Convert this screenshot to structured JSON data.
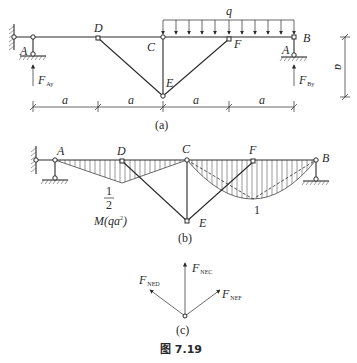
{
  "figure": {
    "caption": "图 7.19",
    "colors": {
      "ink": "#2a2a2a",
      "background": "#ffffff"
    }
  },
  "panel_a": {
    "label": "(a)",
    "load_label": "q",
    "nodes": {
      "A_left": "A",
      "D": "D",
      "C": "C",
      "E": "E",
      "F": "F",
      "B": "B",
      "A_right": "A"
    },
    "reactions": {
      "left": {
        "main": "F",
        "sub": "Ay"
      },
      "right": {
        "main": "F",
        "sub": "By"
      }
    },
    "dimensions": {
      "horizontal": [
        "a",
        "a",
        "a",
        "a"
      ],
      "vertical": "a"
    }
  },
  "panel_b": {
    "label": "(b)",
    "nodes": {
      "A": "A",
      "D": "D",
      "C": "C",
      "F": "F",
      "B": "B",
      "E": "E"
    },
    "moment_label": "M(qa²)",
    "moment_main": "M(qa",
    "moment_sup": "2",
    "moment_close": ")",
    "value_left_num": "1",
    "value_left_den": "2",
    "value_right": "1"
  },
  "panel_c": {
    "label": "(c)",
    "forces": {
      "ED": {
        "main": "F",
        "sub": "NED"
      },
      "EC": {
        "main": "F",
        "sub": "NEC"
      },
      "EF": {
        "main": "F",
        "sub": "NEF"
      }
    }
  }
}
